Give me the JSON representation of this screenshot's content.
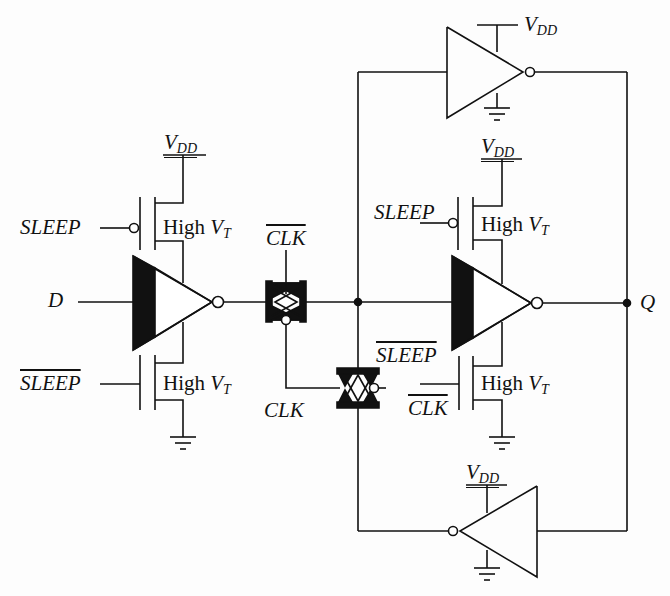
{
  "diagram": {
    "type": "circuit-schematic",
    "colors": {
      "line": "#111111",
      "background": "#fdfdfd"
    },
    "labels": {
      "input_d": "D",
      "output_q": "Q",
      "sleep_top_left": "SLEEP",
      "sleep_bar_bottom_left": "SLEEP",
      "sleep_top_right": "SLEEP",
      "sleep_bar_right": "SLEEP",
      "clk_bar_tg1": "CLK",
      "clk_tg": "CLK",
      "clk_bar_right": "CLK",
      "vdd_main": "V",
      "vdd_sub": "DD",
      "high": "High ",
      "vt_main": "V",
      "vt_sub": "T"
    },
    "components": [
      {
        "id": "inv-in",
        "type": "inverter-mtcmos",
        "label": "input inverter"
      },
      {
        "id": "tg1",
        "type": "transmission-gate",
        "control": "CLK/CLK-bar"
      },
      {
        "id": "tg2",
        "type": "transmission-gate",
        "control": "CLK/CLK-bar"
      },
      {
        "id": "inv-main",
        "type": "inverter-mtcmos",
        "label": "storage inverter"
      },
      {
        "id": "inv-top",
        "type": "inverter",
        "label": "feedback keeper"
      },
      {
        "id": "inv-bottom",
        "type": "inverter",
        "label": "feedback keeper"
      },
      {
        "id": "pmos-sleep-1",
        "type": "pmos",
        "note": "High VT"
      },
      {
        "id": "nmos-sleep-1",
        "type": "nmos",
        "note": "High VT"
      },
      {
        "id": "pmos-sleep-2",
        "type": "pmos",
        "note": "High VT"
      },
      {
        "id": "nmos-sleep-2",
        "type": "nmos",
        "note": "High VT"
      }
    ]
  }
}
